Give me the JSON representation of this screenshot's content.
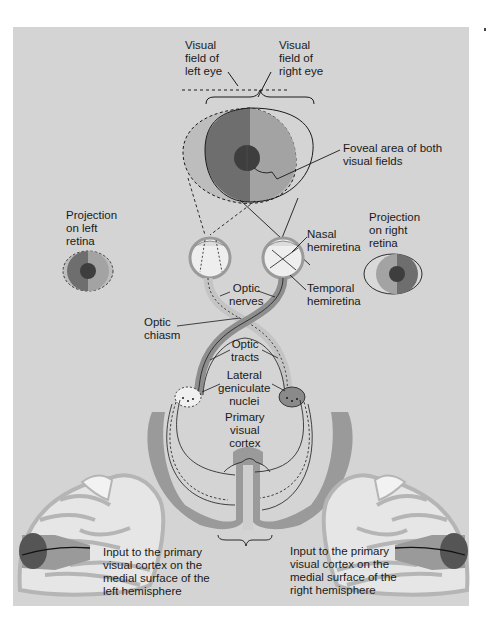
{
  "figure": {
    "colors": {
      "background": "#d4d4d4",
      "left_field_dark": "#6e6e6e",
      "right_field_light": "#a3a3a3",
      "outer_field": "#bdbdbd",
      "fovea": "#3e3e3e",
      "cortex": "#9a9a9a",
      "eyeball": "#eeeeee",
      "line": "#1a1a1a"
    }
  },
  "labels": {
    "visual_field_left": "Visual\nfield of\nleft eye",
    "visual_field_right": "Visual\nfield of\nright eye",
    "foveal_area": "Foveal area of both\nvisual fields",
    "projection_left": "Projection\non left\nretina",
    "projection_right": "Projection\non right\nretina",
    "nasal_hemiretina": "Nasal\nhemiretina",
    "temporal_hemiretina": "Temporal\nhemiretina",
    "optic_nerves": "Optic\nnerves",
    "optic_chiasm": "Optic\nchiasm",
    "optic_tracts": "Optic\ntracts",
    "lateral_geniculate": "Lateral\ngeniculate\nnuclei",
    "primary_visual_cortex": "Primary\nvisual\ncortex",
    "input_left": "Input to the primary\nvisual cortex on the\nmedial surface of the\nleft hemisphere",
    "input_right": "Input to the primary\nvisual cortex on the\nmedial surface of the\nright hemisphere"
  }
}
